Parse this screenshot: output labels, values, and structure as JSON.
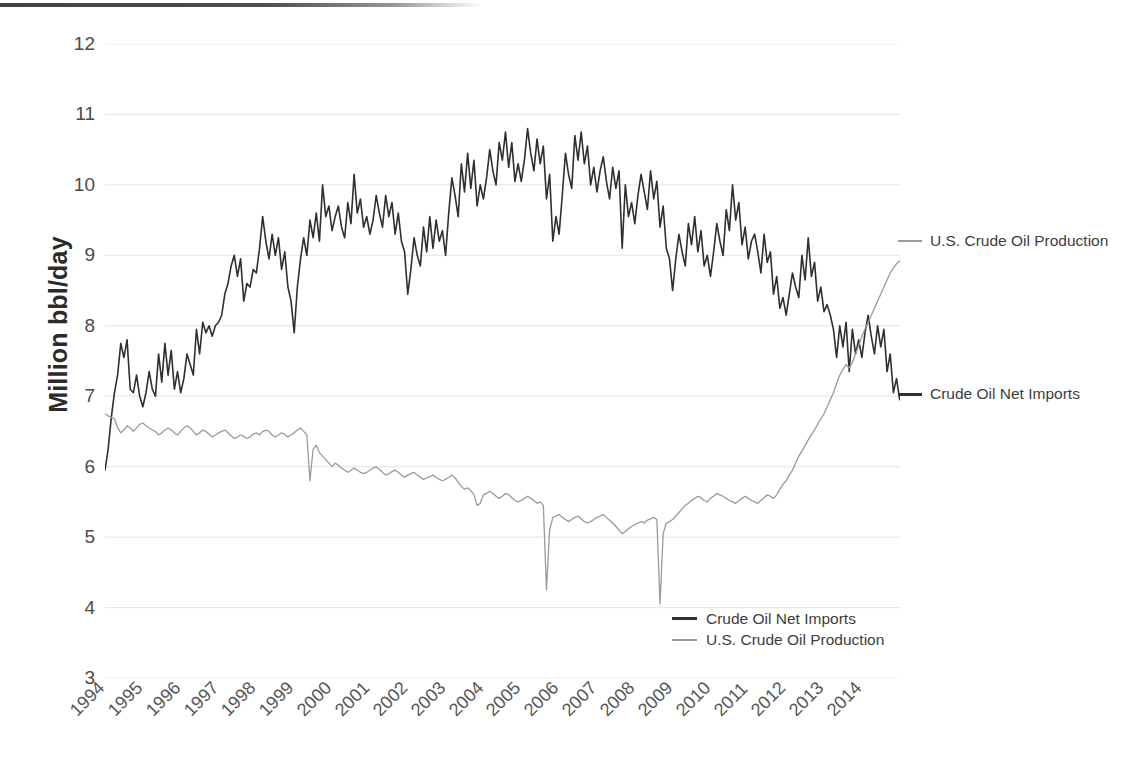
{
  "figure": {
    "y_axis_title": "Million bbl/day"
  },
  "legend": {
    "position": "bottom-center",
    "items": [
      {
        "label": "Crude Oil Net Imports",
        "color": "#2f2f2f"
      },
      {
        "label": "U.S. Crude Oil Production",
        "color": "#9a9a9a"
      }
    ]
  },
  "callouts": [
    {
      "name": "production",
      "label": "U.S. Crude Oil Production",
      "color": "#9a9a9a"
    },
    {
      "name": "imports",
      "label": "Crude Oil Net Imports",
      "color": "#2f2f2f"
    }
  ],
  "chart_data": {
    "type": "line",
    "title": "",
    "xlabel": "",
    "ylabel": "Million bbl/day",
    "ylim": [
      3,
      12
    ],
    "yticks": [
      3,
      4,
      5,
      6,
      7,
      8,
      9,
      10,
      11,
      12
    ],
    "ytick_labels": [
      "3",
      "4",
      "5",
      "6",
      "7",
      "8",
      "9",
      "10",
      "11",
      "12"
    ],
    "grid": "horizontal",
    "xlim": [
      1994,
      2015
    ],
    "xticks": [
      1994,
      1995,
      1996,
      1997,
      1998,
      1999,
      2000,
      2001,
      2002,
      2003,
      2004,
      2005,
      2006,
      2007,
      2008,
      2009,
      2010,
      2011,
      2012,
      2013,
      2014
    ],
    "xtick_labels": [
      "1994",
      "1995",
      "1996",
      "1997",
      "1998",
      "1999",
      "2000",
      "2001",
      "2002",
      "2003",
      "2004",
      "2005",
      "2006",
      "2007",
      "2008",
      "2009",
      "2010",
      "2011",
      "2012",
      "2013",
      "2014"
    ],
    "xtick_rotation": -45,
    "legend_position": "bottom-center",
    "series": [
      {
        "name": "Crude Oil Net Imports",
        "color": "#2f2f2f",
        "linewidth": 1.6,
        "x_start": 1994.0,
        "x_step": 0.0833,
        "values": [
          5.95,
          6.25,
          6.7,
          7.05,
          7.3,
          7.75,
          7.55,
          7.8,
          7.1,
          7.05,
          7.3,
          7.0,
          6.85,
          7.05,
          7.35,
          7.1,
          7.0,
          7.6,
          7.2,
          7.75,
          7.3,
          7.65,
          7.1,
          7.35,
          7.05,
          7.25,
          7.6,
          7.45,
          7.3,
          7.95,
          7.6,
          8.05,
          7.9,
          8.0,
          7.85,
          8.0,
          8.05,
          8.15,
          8.45,
          8.6,
          8.85,
          9.0,
          8.7,
          8.95,
          8.35,
          8.6,
          8.55,
          8.8,
          8.75,
          9.1,
          9.55,
          9.2,
          8.95,
          9.3,
          9.0,
          9.25,
          8.8,
          9.05,
          8.55,
          8.35,
          7.9,
          8.55,
          8.95,
          9.25,
          9.0,
          9.5,
          9.25,
          9.6,
          9.2,
          10.0,
          9.55,
          9.7,
          9.35,
          9.55,
          9.7,
          9.4,
          9.25,
          9.75,
          9.45,
          10.15,
          9.6,
          9.8,
          9.4,
          9.55,
          9.3,
          9.5,
          9.85,
          9.6,
          9.4,
          9.85,
          9.55,
          9.75,
          9.3,
          9.6,
          9.2,
          9.05,
          8.45,
          8.8,
          9.25,
          9.0,
          8.85,
          9.4,
          9.05,
          9.55,
          9.1,
          9.5,
          9.2,
          9.35,
          9.0,
          9.6,
          10.1,
          9.85,
          9.55,
          10.3,
          9.9,
          10.45,
          9.95,
          10.35,
          9.7,
          10.0,
          9.8,
          10.1,
          10.5,
          10.2,
          10.0,
          10.6,
          10.35,
          10.75,
          10.25,
          10.6,
          10.05,
          10.3,
          10.05,
          10.35,
          10.8,
          10.45,
          10.2,
          10.65,
          10.3,
          10.55,
          9.8,
          10.15,
          9.2,
          9.55,
          9.3,
          9.85,
          10.45,
          10.15,
          9.95,
          10.7,
          10.35,
          10.75,
          10.3,
          10.55,
          10.0,
          10.25,
          9.9,
          10.2,
          10.4,
          10.05,
          9.8,
          10.25,
          9.95,
          10.2,
          9.1,
          10.0,
          9.55,
          9.75,
          9.45,
          9.85,
          10.15,
          9.9,
          9.65,
          10.2,
          9.8,
          10.05,
          9.4,
          9.7,
          9.1,
          8.95,
          8.5,
          8.95,
          9.3,
          9.05,
          8.85,
          9.45,
          9.15,
          9.55,
          9.05,
          9.35,
          8.85,
          9.0,
          8.7,
          9.05,
          9.45,
          9.2,
          9.0,
          9.65,
          9.35,
          10.0,
          9.5,
          9.75,
          9.15,
          9.4,
          8.95,
          9.2,
          9.3,
          9.05,
          8.75,
          9.3,
          8.9,
          9.05,
          8.45,
          8.7,
          8.25,
          8.4,
          8.15,
          8.45,
          8.75,
          8.55,
          8.4,
          9.0,
          8.65,
          9.25,
          8.7,
          8.9,
          8.35,
          8.55,
          8.2,
          8.3,
          8.15,
          7.95,
          7.55,
          8.0,
          7.7,
          8.05,
          7.35,
          7.95,
          7.6,
          7.8,
          7.55,
          7.9,
          8.15,
          7.85,
          7.6,
          8.0,
          7.7,
          7.95,
          7.35,
          7.6,
          7.05,
          7.25,
          6.95,
          7.25,
          7.5,
          7.3,
          7.05,
          7.45,
          7.15,
          7.35,
          6.8,
          7.0,
          6.7,
          6.9
        ]
      },
      {
        "name": "U.S. Crude Oil Production",
        "color": "#9a9a9a",
        "linewidth": 1.3,
        "x_start": 1994.0,
        "x_step": 0.0833,
        "values": [
          6.75,
          6.72,
          6.7,
          6.68,
          6.55,
          6.48,
          6.52,
          6.58,
          6.55,
          6.5,
          6.55,
          6.6,
          6.62,
          6.58,
          6.55,
          6.52,
          6.5,
          6.45,
          6.48,
          6.52,
          6.55,
          6.52,
          6.48,
          6.45,
          6.5,
          6.55,
          6.58,
          6.55,
          6.5,
          6.45,
          6.48,
          6.52,
          6.5,
          6.46,
          6.42,
          6.45,
          6.48,
          6.5,
          6.52,
          6.48,
          6.44,
          6.4,
          6.42,
          6.45,
          6.43,
          6.4,
          6.42,
          6.46,
          6.48,
          6.45,
          6.5,
          6.52,
          6.5,
          6.45,
          6.42,
          6.45,
          6.48,
          6.46,
          6.42,
          6.45,
          6.48,
          6.52,
          6.55,
          6.5,
          6.45,
          5.8,
          6.25,
          6.3,
          6.2,
          6.15,
          6.1,
          6.05,
          6.0,
          6.05,
          6.02,
          5.98,
          5.95,
          5.92,
          5.95,
          5.98,
          5.95,
          5.92,
          5.9,
          5.92,
          5.95,
          5.98,
          6.0,
          5.96,
          5.92,
          5.88,
          5.9,
          5.93,
          5.95,
          5.92,
          5.88,
          5.85,
          5.88,
          5.9,
          5.92,
          5.88,
          5.85,
          5.82,
          5.84,
          5.86,
          5.88,
          5.85,
          5.82,
          5.8,
          5.82,
          5.85,
          5.88,
          5.84,
          5.78,
          5.72,
          5.68,
          5.7,
          5.66,
          5.6,
          5.45,
          5.48,
          5.6,
          5.62,
          5.65,
          5.62,
          5.58,
          5.55,
          5.58,
          5.62,
          5.6,
          5.56,
          5.52,
          5.5,
          5.52,
          5.55,
          5.58,
          5.55,
          5.52,
          5.48,
          5.5,
          5.45,
          4.25,
          5.1,
          5.28,
          5.3,
          5.32,
          5.28,
          5.25,
          5.22,
          5.25,
          5.28,
          5.3,
          5.26,
          5.22,
          5.2,
          5.22,
          5.25,
          5.28,
          5.3,
          5.32,
          5.28,
          5.24,
          5.2,
          5.15,
          5.1,
          5.05,
          5.08,
          5.12,
          5.15,
          5.18,
          5.2,
          5.22,
          5.2,
          5.24,
          5.26,
          5.28,
          5.25,
          4.05,
          5.05,
          5.2,
          5.22,
          5.25,
          5.3,
          5.35,
          5.4,
          5.45,
          5.48,
          5.52,
          5.55,
          5.58,
          5.56,
          5.52,
          5.5,
          5.55,
          5.58,
          5.62,
          5.6,
          5.58,
          5.55,
          5.52,
          5.5,
          5.48,
          5.52,
          5.55,
          5.58,
          5.55,
          5.52,
          5.5,
          5.48,
          5.52,
          5.56,
          5.6,
          5.58,
          5.55,
          5.6,
          5.68,
          5.75,
          5.8,
          5.88,
          5.95,
          6.05,
          6.15,
          6.22,
          6.3,
          6.38,
          6.45,
          6.52,
          6.6,
          6.68,
          6.75,
          6.85,
          6.95,
          7.05,
          7.18,
          7.3,
          7.38,
          7.45,
          7.4,
          7.48,
          7.6,
          7.72,
          7.85,
          7.95,
          8.05,
          8.15,
          8.25,
          8.35,
          8.45,
          8.55,
          8.65,
          8.75,
          8.82,
          8.88,
          8.92,
          8.95,
          8.98,
          9.0,
          9.02,
          9.04,
          9.06,
          9.08,
          9.08,
          9.09,
          9.1,
          9.1
        ]
      }
    ]
  }
}
